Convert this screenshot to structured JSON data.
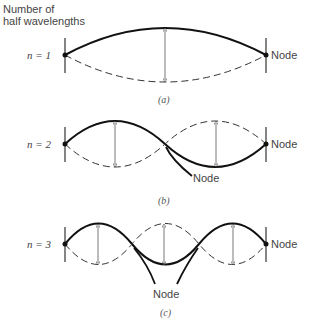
{
  "header": {
    "line1": "Number of",
    "line2": "half wavelengths"
  },
  "node_label": "Node",
  "panels": [
    {
      "n_label": "n = 1",
      "caption": "(a)",
      "half_wavelengths": 1
    },
    {
      "n_label": "n = 2",
      "caption": "(b)",
      "half_wavelengths": 2
    },
    {
      "n_label": "n = 3",
      "caption": "(c)",
      "half_wavelengths": 3
    }
  ]
}
